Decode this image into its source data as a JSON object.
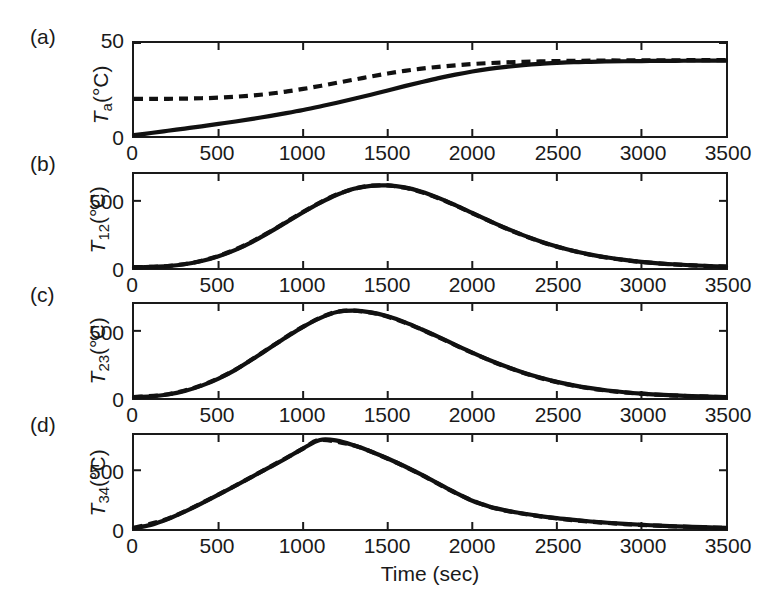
{
  "figure": {
    "background": "#ffffff",
    "ink_color": "#111111",
    "panel_letters": [
      "(a)",
      "(b)",
      "(c)",
      "(d)"
    ],
    "xaxis_title": "Time (sec)"
  },
  "chart_data": [
    {
      "type": "line",
      "panel": "(a)",
      "title": "",
      "xlabel": "",
      "ylabel": "T_a(°C)",
      "ylabel_base": "T",
      "ylabel_sub": "a",
      "ylabel_unit": "(°C)",
      "xlim": [
        0,
        3500
      ],
      "ylim": [
        0,
        50
      ],
      "xticks": [
        0,
        500,
        1000,
        1500,
        2000,
        2500,
        3000,
        3500
      ],
      "xticklabels": [
        "0",
        "500",
        "1000",
        "1500",
        "2000",
        "2500",
        "3000",
        "3500"
      ],
      "yticks": [
        0,
        50
      ],
      "yticklabels": [
        "0",
        "50"
      ],
      "grid": false,
      "legend": "none",
      "series": [
        {
          "name": "measured",
          "style": "solid",
          "x": [
            0,
            100,
            200,
            300,
            400,
            500,
            600,
            700,
            800,
            900,
            1000,
            1100,
            1200,
            1300,
            1400,
            1500,
            1600,
            1700,
            1800,
            1900,
            2000,
            2100,
            2200,
            2300,
            2400,
            2500,
            2600,
            2700,
            2800,
            2900,
            3000,
            3100,
            3200,
            3300,
            3400,
            3500
          ],
          "y": [
            0.5,
            1.6,
            2.8,
            4.0,
            5.2,
            6.5,
            7.8,
            9.2,
            10.7,
            12.3,
            14.0,
            15.9,
            17.9,
            20.0,
            22.2,
            24.5,
            26.8,
            29.0,
            31.1,
            33.0,
            34.7,
            36.1,
            37.2,
            38.1,
            38.8,
            39.3,
            39.7,
            39.9,
            40.1,
            40.2,
            40.3,
            40.4,
            40.4,
            40.5,
            40.5,
            40.5
          ]
        },
        {
          "name": "model",
          "style": "dashed",
          "x": [
            0,
            100,
            200,
            300,
            400,
            500,
            600,
            700,
            800,
            900,
            1000,
            1100,
            1200,
            1300,
            1400,
            1500,
            1600,
            1700,
            1800,
            1900,
            2000,
            2100,
            2200,
            2300,
            2400,
            2500,
            2600,
            2700,
            2800,
            2900,
            3000,
            3100,
            3200,
            3300,
            3400,
            3500
          ],
          "y": [
            20.0,
            20.0,
            20.0,
            20.1,
            20.3,
            20.6,
            21.1,
            21.8,
            22.7,
            23.9,
            25.3,
            26.9,
            28.6,
            30.3,
            32.0,
            33.6,
            35.0,
            36.2,
            37.2,
            38.0,
            38.7,
            39.2,
            39.6,
            39.9,
            40.1,
            40.3,
            40.4,
            40.5,
            40.6,
            40.6,
            40.7,
            40.7,
            40.7,
            40.8,
            40.8,
            40.8
          ]
        }
      ]
    },
    {
      "type": "line",
      "panel": "(b)",
      "title": "",
      "xlabel": "",
      "ylabel": "T_12(°C)",
      "ylabel_base": "T",
      "ylabel_sub": "12",
      "ylabel_unit": "(°C)",
      "xlim": [
        0,
        3500
      ],
      "ylim": [
        0,
        700
      ],
      "xticks": [
        0,
        500,
        1000,
        1500,
        2000,
        2500,
        3000,
        3500
      ],
      "xticklabels": [
        "0",
        "500",
        "1000",
        "1500",
        "2000",
        "2500",
        "3000",
        "3500"
      ],
      "yticks": [
        0,
        500
      ],
      "yticklabels": [
        "0",
        "500"
      ],
      "grid": false,
      "legend": "none",
      "peak": {
        "x": 1370,
        "y": 615
      },
      "series": [
        {
          "name": "measured",
          "style": "solid",
          "x": [
            0,
            100,
            200,
            300,
            400,
            500,
            600,
            700,
            800,
            900,
            1000,
            1100,
            1200,
            1300,
            1400,
            1500,
            1600,
            1700,
            1800,
            1900,
            2000,
            2100,
            2200,
            2300,
            2400,
            2500,
            2600,
            2700,
            2800,
            2900,
            3000,
            3100,
            3200,
            3300,
            3400,
            3500
          ],
          "y": [
            5,
            8,
            14,
            28,
            52,
            88,
            135,
            195,
            265,
            340,
            415,
            485,
            545,
            590,
            612,
            615,
            600,
            568,
            522,
            468,
            410,
            352,
            296,
            245,
            200,
            160,
            127,
            100,
            78,
            60,
            46,
            35,
            27,
            20,
            15,
            10
          ]
        },
        {
          "name": "model",
          "style": "dashed",
          "x": [
            0,
            200,
            400,
            600,
            800,
            1000,
            1200,
            1400,
            1600,
            1800,
            2000,
            2200,
            2400,
            2600,
            2800,
            3000,
            3200,
            3400,
            3500
          ],
          "y": [
            6,
            15,
            54,
            138,
            268,
            418,
            548,
            613,
            598,
            520,
            408,
            294,
            198,
            126,
            76,
            45,
            26,
            14,
            10
          ]
        }
      ]
    },
    {
      "type": "line",
      "panel": "(c)",
      "title": "",
      "xlabel": "",
      "ylabel": "T_23(°C)",
      "ylabel_base": "T",
      "ylabel_sub": "23",
      "ylabel_unit": "(°C)",
      "xlim": [
        0,
        3500
      ],
      "ylim": [
        0,
        700
      ],
      "xticks": [
        0,
        500,
        1000,
        1500,
        2000,
        2500,
        3000,
        3500
      ],
      "xticklabels": [
        "0",
        "500",
        "1000",
        "1500",
        "2000",
        "2500",
        "3000",
        "3500"
      ],
      "yticks": [
        0,
        500
      ],
      "yticklabels": [
        "0",
        "500"
      ],
      "grid": false,
      "legend": "none",
      "peak": {
        "x": 1240,
        "y": 650
      },
      "series": [
        {
          "name": "measured",
          "style": "solid",
          "x": [
            0,
            100,
            200,
            300,
            400,
            500,
            600,
            700,
            800,
            900,
            1000,
            1100,
            1200,
            1300,
            1400,
            1500,
            1600,
            1700,
            1800,
            1900,
            2000,
            2100,
            2200,
            2300,
            2400,
            2500,
            2600,
            2700,
            2800,
            2900,
            3000,
            3100,
            3200,
            3300,
            3400,
            3500
          ],
          "y": [
            6,
            12,
            26,
            52,
            92,
            145,
            210,
            288,
            370,
            452,
            530,
            595,
            640,
            650,
            638,
            608,
            565,
            512,
            455,
            396,
            338,
            283,
            234,
            190,
            152,
            120,
            94,
            73,
            56,
            43,
            33,
            25,
            19,
            14,
            10,
            7
          ]
        },
        {
          "name": "model",
          "style": "dashed",
          "x": [
            0,
            200,
            400,
            600,
            800,
            1000,
            1200,
            1400,
            1600,
            1800,
            2000,
            2200,
            2400,
            2600,
            2800,
            3000,
            3200,
            3400,
            3500
          ],
          "y": [
            7,
            28,
            95,
            212,
            372,
            532,
            642,
            636,
            562,
            452,
            336,
            232,
            150,
            92,
            54,
            32,
            18,
            10,
            7
          ]
        }
      ]
    },
    {
      "type": "line",
      "panel": "(d)",
      "title": "",
      "xlabel": "Time (sec)",
      "ylabel": "T_34(°C)",
      "ylabel_base": "T",
      "ylabel_sub": "34",
      "ylabel_unit": "(°C)",
      "xlim": [
        0,
        3500
      ],
      "ylim": [
        0,
        800
      ],
      "xticks": [
        0,
        500,
        1000,
        1500,
        2000,
        2500,
        3000,
        3500
      ],
      "xticklabels": [
        "0",
        "500",
        "1000",
        "1500",
        "2000",
        "2500",
        "3000",
        "3500"
      ],
      "yticks": [
        0,
        500
      ],
      "yticklabels": [
        "0",
        "500"
      ],
      "grid": false,
      "legend": "none",
      "peak": {
        "x": 1090,
        "y": 760
      },
      "series": [
        {
          "name": "measured",
          "style": "solid",
          "x": [
            0,
            100,
            200,
            300,
            400,
            500,
            600,
            700,
            800,
            900,
            1000,
            1100,
            1200,
            1300,
            1400,
            1500,
            1600,
            1700,
            1800,
            1900,
            2000,
            2100,
            2200,
            2300,
            2400,
            2500,
            2600,
            2700,
            2800,
            2900,
            3000,
            3100,
            3200,
            3300,
            3400,
            3500
          ],
          "y": [
            8,
            35,
            85,
            148,
            218,
            292,
            368,
            446,
            524,
            602,
            686,
            758,
            752,
            712,
            660,
            600,
            534,
            462,
            386,
            310,
            240,
            192,
            158,
            132,
            110,
            92,
            77,
            64,
            53,
            44,
            36,
            29,
            23,
            18,
            14,
            10
          ]
        },
        {
          "name": "model",
          "style": "dashed",
          "x": [
            0,
            200,
            400,
            600,
            800,
            1000,
            1100,
            1300,
            1500,
            1700,
            1900,
            2100,
            2300,
            2500,
            2700,
            2900,
            3100,
            3300,
            3500
          ],
          "y": [
            9,
            88,
            220,
            370,
            526,
            684,
            757,
            710,
            598,
            460,
            308,
            190,
            130,
            90,
            62,
            42,
            28,
            17,
            10
          ]
        }
      ]
    }
  ]
}
